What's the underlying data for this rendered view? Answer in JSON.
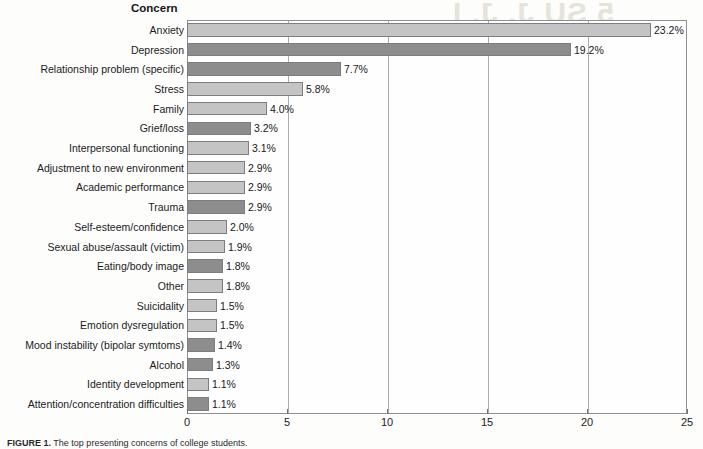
{
  "chart_data": {
    "type": "bar",
    "orientation": "horizontal",
    "title": "Concern",
    "xlabel": "",
    "ylabel": "Concern",
    "xlim": [
      0,
      25
    ],
    "xticks": [
      0,
      5,
      10,
      15,
      20,
      25
    ],
    "xtick_labels": [
      "0",
      "5",
      "10",
      "15",
      "20",
      "25"
    ],
    "grid": true,
    "grid_axis": "x",
    "legend": null,
    "value_suffix": "%",
    "categories": [
      "Anxiety",
      "Depression",
      "Relationship problem (specific)",
      "Stress",
      "Family",
      "Grief/loss",
      "Interpersonal functioning",
      "Adjustment to new environment",
      "Academic performance",
      "Trauma",
      "Self-esteem/confidence",
      "Sexual abuse/assault (victim)",
      "Eating/body image",
      "Other",
      "Suicidality",
      "Emotion dysregulation",
      "Mood instability (bipolar symtoms)",
      "Alcohol",
      "Identity development",
      "Attention/concentration difficulties"
    ],
    "values": [
      23.2,
      19.2,
      7.7,
      5.8,
      4.0,
      3.2,
      3.1,
      2.9,
      2.9,
      2.9,
      2.0,
      1.9,
      1.8,
      1.8,
      1.5,
      1.5,
      1.4,
      1.3,
      1.1,
      1.1
    ],
    "value_labels": [
      "23.2%",
      "19.2%",
      "7.7%",
      "5.8%",
      "4.0%",
      "3.2%",
      "3.1%",
      "2.9%",
      "2.9%",
      "2.9%",
      "2.0%",
      "1.9%",
      "1.8%",
      "1.8%",
      "1.5%",
      "1.5%",
      "1.4%",
      "1.3%",
      "1.1%",
      "1.1%"
    ],
    "bar_shades": [
      "light",
      "dark",
      "dark",
      "light",
      "light",
      "dark",
      "light",
      "light",
      "light",
      "dark",
      "light",
      "light",
      "dark",
      "light",
      "light",
      "light",
      "dark",
      "dark",
      "light",
      "dark"
    ],
    "colors": {
      "bar_light": "#c3c4c3",
      "bar_dark": "#8c8d8c",
      "bar_border": "#7b7d80",
      "grid": "#a9abae",
      "axis": "#8d8f92",
      "text": "#1b1b1e",
      "page_background": "#fdfdfc"
    }
  },
  "caption": {
    "label": "FIGURE 1.",
    "text": " The top presenting concerns of college students."
  },
  "ghost_text": {
    "line1": "5 SU J. J. I",
    "line2": "Psychological Dis",
    "line3": "n Retrospective",
    "line4": "stud",
    "line5": "svchological",
    "line6": "orders"
  }
}
